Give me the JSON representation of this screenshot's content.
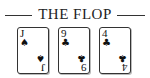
{
  "header": {
    "title": "THE FLOP"
  },
  "cards": [
    {
      "rank": "J",
      "suit": "spades",
      "suit_glyph": "♠",
      "left": 17
    },
    {
      "rank": "9",
      "suit": "clubs",
      "suit_glyph": "♣",
      "left": 58
    },
    {
      "rank": "4",
      "suit": "clubs",
      "suit_glyph": "♣",
      "left": 99
    }
  ]
}
